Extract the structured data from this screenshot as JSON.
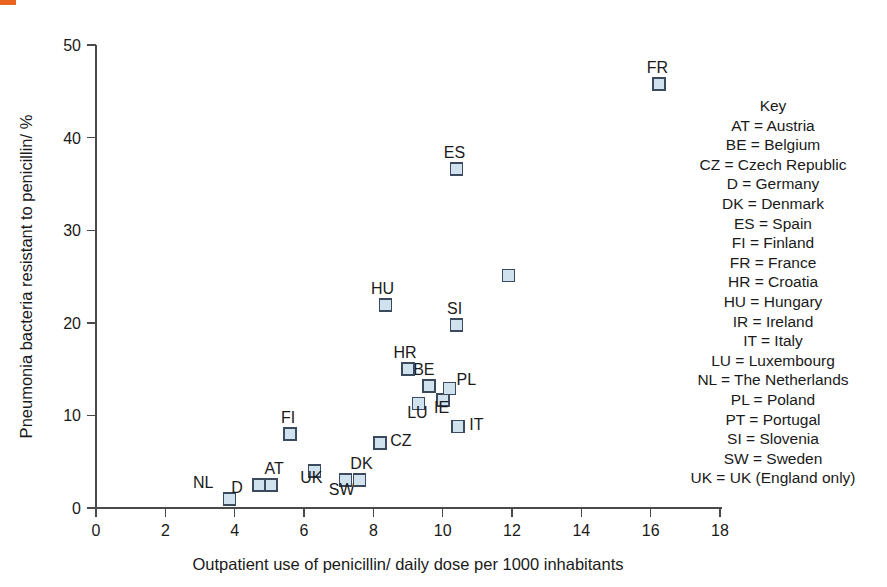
{
  "chart_data": {
    "type": "scatter",
    "title": "",
    "xlabel": "Outpatient use of penicillin/ daily dose per 1000 inhabitants",
    "ylabel": "Pneumonia bacteria resistant to penicillin/ %",
    "xlim": [
      0,
      18
    ],
    "ylim": [
      0,
      50
    ],
    "xticks": [
      "0",
      "2",
      "4",
      "6",
      "8",
      "10",
      "12",
      "14",
      "16",
      "18"
    ],
    "yticks": [
      "0",
      "10",
      "20",
      "30",
      "40",
      "50"
    ],
    "grid": false,
    "legend_position": "right",
    "marker_fill": "#cfe2ee",
    "marker_stroke": "#3b4a5c",
    "points": [
      {
        "code": "NL",
        "x": 3.85,
        "y": 1.0,
        "label_dx": -16,
        "label_dy": -9
      },
      {
        "code": "D",
        "x": 4.7,
        "y": 2.5,
        "label_dx": -16,
        "label_dy": 10
      },
      {
        "code": "AT",
        "x": 5.05,
        "y": 2.5,
        "label_dx": 3,
        "label_dy": -9
      },
      {
        "code": "SW",
        "x": 7.2,
        "y": 3.0,
        "label_dx": -4,
        "label_dy": 17
      },
      {
        "code": "DK",
        "x": 7.6,
        "y": 3.0,
        "label_dx": 2,
        "label_dy": -9
      },
      {
        "code": "UK",
        "x": 6.3,
        "y": 4.0,
        "label_dx": -3,
        "label_dy": 14
      },
      {
        "code": "CZ",
        "x": 8.2,
        "y": 7.0,
        "label_dx": 10,
        "label_dy": 5
      },
      {
        "code": "FI",
        "x": 5.6,
        "y": 8.0,
        "label_dx": -2,
        "label_dy": -9
      },
      {
        "code": "IT",
        "x": 10.45,
        "y": 8.8,
        "label_dx": 11,
        "label_dy": 5
      },
      {
        "code": "LU",
        "x": 9.3,
        "y": 11.3,
        "label_dx": -1,
        "label_dy": 17
      },
      {
        "code": "IE",
        "x": 10.0,
        "y": 11.7,
        "label_dx": -1,
        "label_dy": 15
      },
      {
        "code": "PL",
        "x": 10.2,
        "y": 12.9,
        "label_dx": 7,
        "label_dy": -2
      },
      {
        "code": "BE",
        "x": 9.6,
        "y": 13.2,
        "label_dx": -5,
        "label_dy": -9
      },
      {
        "code": "HR",
        "x": 9.0,
        "y": 15.0,
        "label_dx": -3,
        "label_dy": -9
      },
      {
        "code": "SI",
        "x": 10.4,
        "y": 19.8,
        "label_dx": -2,
        "label_dy": -9
      },
      {
        "code": "HU",
        "x": 8.35,
        "y": 21.9,
        "label_dx": -3,
        "label_dy": -9
      },
      {
        "code": "PT",
        "x": 11.9,
        "y": 25.1,
        "label_dx": 0,
        "label_dy": 0,
        "label_hidden": true
      },
      {
        "code": "ES",
        "x": 10.4,
        "y": 36.6,
        "label_dx": -2,
        "label_dy": -9
      },
      {
        "code": "FR",
        "x": 16.25,
        "y": 45.8,
        "label_dx": -2,
        "label_dy": -9
      }
    ]
  },
  "key": {
    "title": "Key",
    "entries": [
      "AT = Austria",
      "BE = Belgium",
      "CZ = Czech Republic",
      "D = Germany",
      "DK = Denmark",
      "ES = Spain",
      "FI = Finland",
      "FR = France",
      "HR = Croatia",
      "HU = Hungary",
      "IR = Ireland",
      "IT = Italy",
      "LU = Luxembourg",
      "NL = The Netherlands",
      "PL = Poland",
      "PT = Portugal",
      "SI = Slovenia",
      "SW = Sweden",
      "UK = UK (England only)"
    ]
  }
}
